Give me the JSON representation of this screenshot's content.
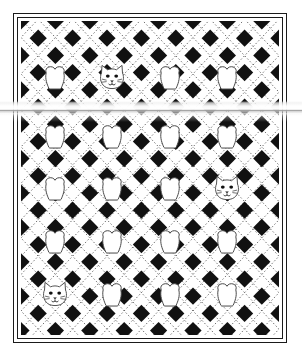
{
  "document": {
    "kind": "quilt-pattern-diagram",
    "title": "Quilt Pattern Diagram",
    "background_color": "#ffffff",
    "ink_color": "#1a1a1a"
  },
  "border": {
    "style": "double-rule",
    "outer": {
      "x": 13,
      "y": 13,
      "width": 274,
      "height": 330,
      "stroke_width": 1.4,
      "color": "#1a1a1a"
    },
    "inner": {
      "x": 17,
      "y": 17,
      "width": 266,
      "height": 322,
      "stroke_width": 1.2,
      "color": "#1a1a1a"
    }
  },
  "field": {
    "x": 21,
    "y": 21,
    "width": 258,
    "height": 314,
    "background_color": "#ffffff"
  },
  "lattice": {
    "description": "diagonal checkerboard of solid black diamonds with dotted white diamonds between them",
    "cell_width": 17.2,
    "cell_height": 17.2,
    "columns": 16,
    "rows": 19,
    "diamond_fill": "#111111",
    "dotted_outline_color": "#3a3a3a",
    "dash_pattern": "1.4 2.2"
  },
  "motifs": {
    "columns": 4,
    "rows": 5,
    "column_centers": [
      55,
      112,
      170,
      227
    ],
    "row_centers": [
      78,
      137,
      189,
      242,
      295
    ],
    "heart_label": "heart-motif",
    "cat_label": "cat-face-motif",
    "stroke_color": "#4a4a4a",
    "fill_color": "#ffffff",
    "grid": [
      [
        "heart",
        "cat",
        "heart",
        "heart"
      ],
      [
        "heart",
        "heart",
        "heart",
        "heart"
      ],
      [
        "heart",
        "heart",
        "heart",
        "cat"
      ],
      [
        "heart",
        "heart",
        "heart",
        "heart"
      ],
      [
        "cat",
        "heart",
        "heart",
        "heart"
      ]
    ]
  },
  "cat_face": {
    "ears": 2,
    "eyes": 2,
    "nose": 1,
    "whisker_lines": 4,
    "mouth": "w-shape"
  },
  "artifact": {
    "type": "scanner-glare-band",
    "top": 101,
    "height": 15,
    "full_bleed": true,
    "highlight_color": "#ffffff",
    "shadow_color": "#c6c6c6"
  }
}
